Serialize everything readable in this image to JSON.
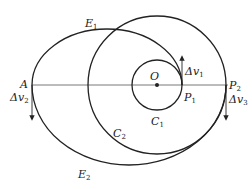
{
  "diagram": {
    "colors": {
      "stroke": "#222222",
      "background": "#ffffff"
    },
    "points": {
      "O": {
        "label": "O"
      },
      "A": {
        "label": "A"
      },
      "P1": {
        "label": "P",
        "sub": "1"
      },
      "P2": {
        "label": "P",
        "sub": "2"
      }
    },
    "orbits": {
      "C1": {
        "label": "C",
        "sub": "1"
      },
      "C2": {
        "label": "C",
        "sub": "2"
      },
      "E1": {
        "label": "E",
        "sub": "1"
      },
      "E2": {
        "label": "E",
        "sub": "2"
      }
    },
    "impulses": {
      "dv1": {
        "label": "Δv",
        "sub": "1"
      },
      "dv2": {
        "label": "Δv",
        "sub": "2"
      },
      "dv3": {
        "label": "Δv",
        "sub": "3"
      }
    }
  }
}
